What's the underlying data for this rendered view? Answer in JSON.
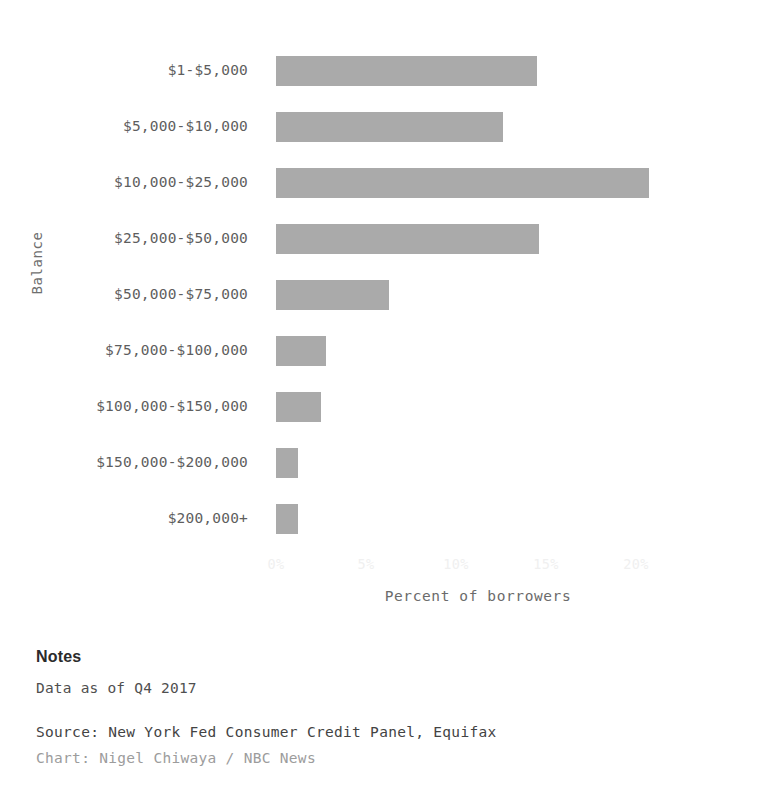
{
  "chart_data": {
    "type": "bar",
    "orientation": "horizontal",
    "title": "",
    "xlabel": "Percent of borrowers",
    "ylabel": "Balance",
    "xlim": [
      0,
      22
    ],
    "xticks": [
      "0%",
      "5%",
      "10%",
      "15%",
      "20%"
    ],
    "xtick_values": [
      0,
      5,
      10,
      15,
      20
    ],
    "grid": false,
    "legend": false,
    "bar_color": "#a3a3a3",
    "categories": [
      "$1-$5,000",
      "$5,000-$10,000",
      "$10,000-$25,000",
      "$25,000-$50,000",
      "$50,000-$75,000",
      "$75,000-$100,000",
      "$100,000-$150,000",
      "$150,000-$200,000",
      "$200,000+"
    ],
    "values": [
      14.5,
      12.6,
      20.7,
      14.6,
      6.3,
      2.8,
      2.5,
      1.2,
      1.2
    ]
  },
  "notes": {
    "heading": "Notes",
    "body": "Data as of Q4 2017",
    "source": "Source: New York Fed Consumer Credit Panel, Equifax",
    "credit": "Chart: Nigel Chiwaya / NBC News"
  }
}
